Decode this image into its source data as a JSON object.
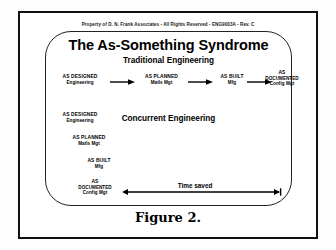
{
  "frame": {
    "copyright": "Property of D. N. Frank Associates  -  All Rights Reserved  -   ENG9003A - Rev. C",
    "title": "The As-Something Syndrome",
    "caption": "Figure 2."
  },
  "sections": {
    "traditional": {
      "heading": "Traditional Engineering",
      "stages": [
        {
          "line1": "AS DESIGNED",
          "line2": "Engineering",
          "line3": ""
        },
        {
          "line1": "AS PLANNED",
          "line2": "Matls Mgt",
          "line3": ""
        },
        {
          "line1": "AS BUILT",
          "line2": "Mfg",
          "line3": ""
        },
        {
          "line1": "AS",
          "line2": "DOCUMENTED",
          "line3": "Config Mgt"
        }
      ]
    },
    "concurrent": {
      "heading": "Concurrent Engineering",
      "stages": [
        {
          "line1": "AS DESIGNED",
          "line2": "Engineering",
          "line3": ""
        },
        {
          "line1": "AS PLANNED",
          "line2": "Matls Mgt",
          "line3": ""
        },
        {
          "line1": "AS BUILT",
          "line2": "Mfg",
          "line3": ""
        },
        {
          "line1": "AS",
          "line2": "DOCUMENTED",
          "line3": "Config Mgt"
        }
      ]
    }
  },
  "annotation": {
    "time_saved_label": "Time saved"
  },
  "colors": {
    "ink": "#000000",
    "frame": "#111111",
    "page": "#ffffff"
  }
}
